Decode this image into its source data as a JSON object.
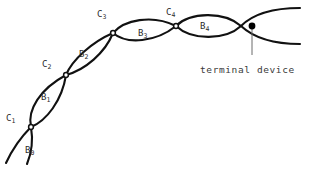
{
  "figure": {
    "type": "chain-of-lens-elements-diagram",
    "background": "#ffffff",
    "stroke_color": "#111111",
    "label_color": "#2b2b2b",
    "node_fill": "#ffffff",
    "terminal_dot_color": "#000000",
    "leader_color": "#6b6b6b"
  },
  "segment_labels": [
    {
      "base": "B",
      "sub": "0",
      "x": 25,
      "y": 146
    },
    {
      "base": "B",
      "sub": "1",
      "x": 41,
      "y": 93
    },
    {
      "base": "B",
      "sub": "2",
      "x": 79,
      "y": 50
    },
    {
      "base": "B",
      "sub": "3",
      "x": 138,
      "y": 29
    },
    {
      "base": "B",
      "sub": "4",
      "x": 200,
      "y": 22
    }
  ],
  "node_labels": [
    {
      "base": "C",
      "sub": "1",
      "x": 6,
      "y": 114
    },
    {
      "base": "C",
      "sub": "2",
      "x": 42,
      "y": 60
    },
    {
      "base": "C",
      "sub": "3",
      "x": 97,
      "y": 10
    },
    {
      "base": "C",
      "sub": "4",
      "x": 166,
      "y": 8
    }
  ],
  "annotation": {
    "text": "terminal device",
    "x": 200,
    "y": 64
  }
}
